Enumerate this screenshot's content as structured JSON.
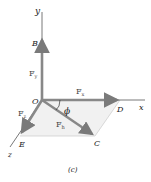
{
  "figure": {
    "caption": "(c)",
    "axes": {
      "x": "x",
      "y": "y",
      "z": "z"
    },
    "points": {
      "origin": "O",
      "B": "B",
      "C": "C",
      "D": "D",
      "E": "E"
    },
    "vectors": {
      "Fy": {
        "main": "F",
        "sub": "y"
      },
      "Fx": {
        "main": "F",
        "sub": "x"
      },
      "Fz": {
        "main": "F",
        "sub": "z"
      },
      "Fh": {
        "main": "F",
        "sub": "h"
      }
    },
    "angle": "ϕ",
    "colors": {
      "axis": "#555555",
      "vector": "#8a8a8a",
      "plane": "#eeeeee",
      "construction": "#cfcfcf"
    }
  }
}
